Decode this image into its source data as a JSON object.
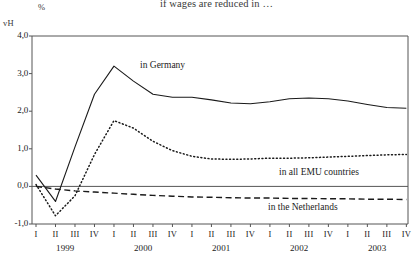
{
  "header": {
    "caption": "if wages are reduced in …",
    "unit_symbol": "%",
    "corner_label": "vH"
  },
  "axis": {
    "y_ticks": [
      "4,0",
      "3,0",
      "2,0",
      "1,0",
      "0,0",
      "-1,0"
    ],
    "x_quarters": [
      "I",
      "II",
      "III",
      "IV",
      "I",
      "II",
      "III",
      "IV",
      "I",
      "II",
      "III",
      "IV",
      "I",
      "II",
      "III",
      "IV",
      "I",
      "II",
      "III",
      "IV"
    ],
    "x_years": [
      "1999",
      "2000",
      "2001",
      "2002",
      "2003"
    ]
  },
  "labels": {
    "germany": "in Germany",
    "emu": "in all EMU countries",
    "netherlands": "in the Netherlands"
  },
  "colors": {
    "line": "#1a1a1a",
    "axis": "#555555",
    "background": "#ffffff"
  },
  "chart_data": {
    "type": "line",
    "title": "if wages are reduced in …",
    "xlabel": "",
    "ylabel": "%",
    "ylim": [
      -1.0,
      4.0
    ],
    "grid": false,
    "legend_position": "inline-annotations",
    "x": [
      "1999 I",
      "1999 II",
      "1999 III",
      "1999 IV",
      "2000 I",
      "2000 II",
      "2000 III",
      "2000 IV",
      "2001 I",
      "2001 II",
      "2001 III",
      "2001 IV",
      "2002 I",
      "2002 II",
      "2002 III",
      "2002 IV",
      "2003 I",
      "2003 II",
      "2003 III",
      "2003 IV"
    ],
    "series": [
      {
        "name": "in Germany",
        "style": "solid",
        "values": [
          0.3,
          -0.4,
          1.05,
          2.45,
          3.2,
          2.8,
          2.45,
          2.37,
          2.37,
          2.3,
          2.22,
          2.2,
          2.25,
          2.33,
          2.35,
          2.33,
          2.27,
          2.18,
          2.1,
          2.08
        ]
      },
      {
        "name": "in all EMU countries",
        "style": "dotted",
        "values": [
          0.05,
          -0.78,
          -0.25,
          0.85,
          1.75,
          1.55,
          1.2,
          0.95,
          0.8,
          0.73,
          0.72,
          0.73,
          0.75,
          0.75,
          0.76,
          0.78,
          0.8,
          0.82,
          0.84,
          0.85
        ]
      },
      {
        "name": "in the Netherlands",
        "style": "dashed",
        "values": [
          0.0,
          -0.07,
          -0.12,
          -0.15,
          -0.18,
          -0.21,
          -0.24,
          -0.26,
          -0.28,
          -0.29,
          -0.3,
          -0.31,
          -0.31,
          -0.32,
          -0.32,
          -0.33,
          -0.33,
          -0.34,
          -0.34,
          -0.35
        ]
      }
    ]
  }
}
